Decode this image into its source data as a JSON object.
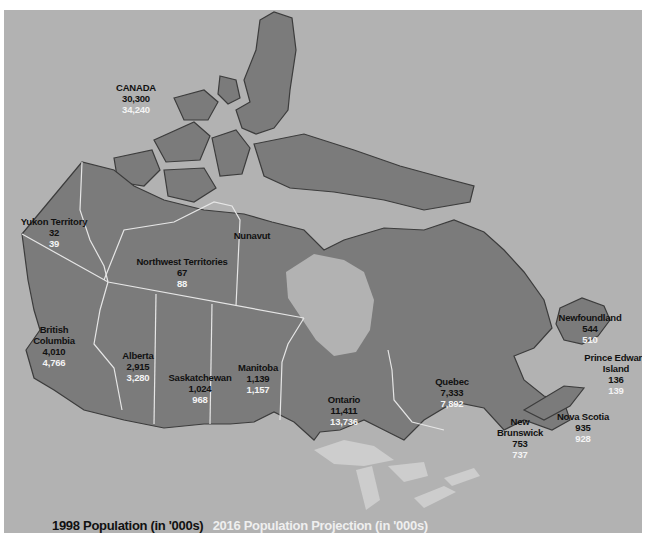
{
  "map": {
    "title": "Canada population by province/territory",
    "colors": {
      "water": "#b2b2b2",
      "land": "#7b7b7b",
      "shadow": "#3c3c3c",
      "border": "#e6e6e6",
      "value_1998": "#111111",
      "value_2016": "#f4f4f4"
    },
    "labels": [
      {
        "id": "canada",
        "name": "CANADA",
        "v1998": "30,300",
        "v2016": "34,240"
      },
      {
        "id": "yukon",
        "name": "Yukon Territory",
        "v1998": "32",
        "v2016": "39"
      },
      {
        "id": "nwt",
        "name": "Northwest Territories",
        "v1998": "67",
        "v2016": "88"
      },
      {
        "id": "nunavut",
        "name": "Nunavut",
        "v1998": "",
        "v2016": ""
      },
      {
        "id": "bc",
        "name": "British Columbia",
        "v1998": "4,010",
        "v2016": "4,766"
      },
      {
        "id": "alberta",
        "name": "Alberta",
        "v1998": "2,915",
        "v2016": "3,280"
      },
      {
        "id": "saskatchewan",
        "name": "Saskatchewan",
        "v1998": "1,024",
        "v2016": "968"
      },
      {
        "id": "manitoba",
        "name": "Manitoba",
        "v1998": "1,139",
        "v2016": "1,157"
      },
      {
        "id": "ontario",
        "name": "Ontario",
        "v1998": "11,411",
        "v2016": "13,736"
      },
      {
        "id": "quebec",
        "name": "Quebec",
        "v1998": "7,333",
        "v2016": "7,892"
      },
      {
        "id": "newfoundland",
        "name": "Newfoundland",
        "v1998": "544",
        "v2016": "510"
      },
      {
        "id": "pei",
        "name": "Prince Edward Island",
        "v1998": "136",
        "v2016": "139"
      },
      {
        "id": "nb",
        "name": "New Brunswick",
        "v1998": "753",
        "v2016": "737"
      },
      {
        "id": "ns",
        "name": "Nova Scotia",
        "v1998": "935",
        "v2016": "928"
      }
    ]
  },
  "legend": {
    "label_1998": "1998 Population (in '000s)",
    "label_2016": "2016 Population Projection (in '000s)"
  }
}
